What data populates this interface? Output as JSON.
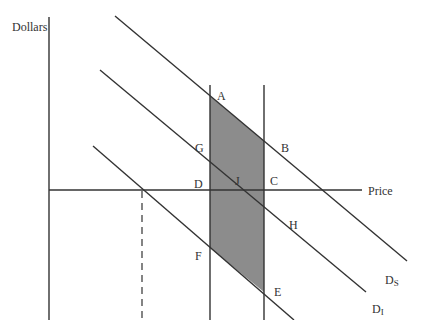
{
  "diagram": {
    "axes": {
      "y_label": "Dollars",
      "x_label": "Price"
    },
    "colors": {
      "line": "#333333",
      "shade": "#8c8c8c",
      "background": "#ffffff"
    },
    "points": {
      "A": "A",
      "B": "B",
      "C": "C",
      "D": "D",
      "E": "E",
      "F": "F",
      "G": "G",
      "H": "H",
      "J": "J"
    },
    "curves": {
      "ds_main": "D",
      "ds_sub": "S",
      "di_main": "D",
      "di_sub": "I"
    },
    "shaded_region": [
      "A",
      "B",
      "E",
      "F"
    ]
  }
}
